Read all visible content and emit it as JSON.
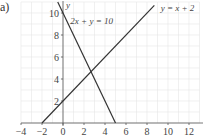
{
  "part_label": "a)",
  "chart_data": {
    "type": "line",
    "title": "",
    "xlabel": "",
    "ylabel": "y",
    "xlim": [
      -4,
      13
    ],
    "ylim": [
      0,
      11
    ],
    "grid": true,
    "x_ticks": [
      -4,
      -2,
      0,
      2,
      4,
      6,
      8,
      10,
      12
    ],
    "y_ticks": [
      2,
      4,
      6,
      8,
      10
    ],
    "series": [
      {
        "name": "2x + y = 10",
        "points": [
          [
            -0.5,
            11
          ],
          [
            5,
            0
          ]
        ],
        "label_pos": [
          0.7,
          9.3
        ]
      },
      {
        "name": "y = x + 2",
        "points": [
          [
            -2,
            0
          ],
          [
            8.7,
            10.7
          ]
        ],
        "label_pos": [
          9.3,
          10.5
        ]
      }
    ],
    "intersection": [
      2.67,
      4.67
    ],
    "line_color": "#333333",
    "grid_color": "#e6e6e6",
    "axis_color": "#555555"
  }
}
